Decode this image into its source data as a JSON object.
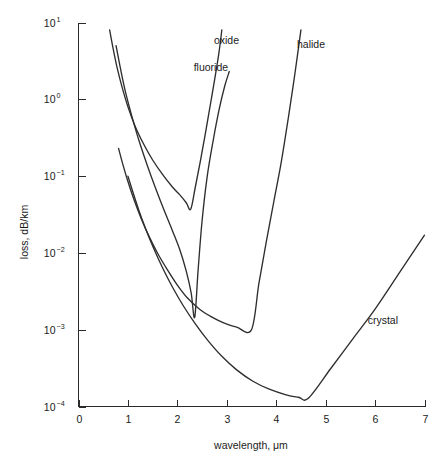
{
  "chart_data": {
    "type": "line",
    "title": "",
    "xlabel": "wavelength, μm",
    "ylabel": "loss, dB/km",
    "xlim": [
      0,
      7
    ],
    "ylim": [
      0.0001,
      10
    ],
    "yscale": "log",
    "xscale": "linear",
    "grid": false,
    "legend_position": "inline-annotations",
    "xticks": [
      "0",
      "1",
      "2",
      "3",
      "4",
      "5",
      "6",
      "7"
    ],
    "xtick_values": [
      0,
      1,
      2,
      3,
      4,
      5,
      6,
      7
    ],
    "yticks": [
      "10¹",
      "10⁰",
      "10⁻¹",
      "10⁻²",
      "10⁻³",
      "10⁻⁴"
    ],
    "ytick_values": [
      10,
      1,
      0.1,
      0.01,
      0.001,
      0.0001
    ],
    "ytick_mantissa": "10",
    "ytick_exponents": [
      "1",
      "0",
      "-1",
      "-2",
      "-3",
      "-4"
    ],
    "series": [
      {
        "name": "oxide",
        "label": "oxide",
        "label_x": 2.74,
        "label_y": 5.2,
        "points": [
          [
            0.63,
            8.0
          ],
          [
            0.7,
            4.6
          ],
          [
            0.78,
            2.6
          ],
          [
            0.88,
            1.45
          ],
          [
            1.0,
            0.8
          ],
          [
            1.15,
            0.44
          ],
          [
            1.32,
            0.26
          ],
          [
            1.5,
            0.162
          ],
          [
            1.7,
            0.105
          ],
          [
            1.9,
            0.072
          ],
          [
            2.05,
            0.057
          ],
          [
            2.18,
            0.045
          ],
          [
            2.27,
            0.037
          ],
          [
            2.36,
            0.07
          ],
          [
            2.46,
            0.15
          ],
          [
            2.56,
            0.34
          ],
          [
            2.66,
            0.8
          ],
          [
            2.76,
            1.9
          ],
          [
            2.84,
            4.0
          ],
          [
            2.9,
            8.0
          ]
        ]
      },
      {
        "name": "fluoride",
        "label": "fluoride",
        "label_x": 2.33,
        "label_y": 2.35,
        "points": [
          [
            0.76,
            5.0
          ],
          [
            0.85,
            2.5
          ],
          [
            0.95,
            1.25
          ],
          [
            1.08,
            0.6
          ],
          [
            1.22,
            0.295
          ],
          [
            1.38,
            0.145
          ],
          [
            1.55,
            0.072
          ],
          [
            1.72,
            0.0375
          ],
          [
            1.9,
            0.0195
          ],
          [
            2.05,
            0.011
          ],
          [
            2.18,
            0.0058
          ],
          [
            2.28,
            0.003
          ],
          [
            2.35,
            0.00145
          ],
          [
            2.42,
            0.006
          ],
          [
            2.5,
            0.026
          ],
          [
            2.6,
            0.095
          ],
          [
            2.72,
            0.28
          ],
          [
            2.85,
            0.76
          ],
          [
            2.96,
            1.5
          ],
          [
            3.05,
            2.3
          ]
        ]
      },
      {
        "name": "halide",
        "label": "halide",
        "label_x": 4.42,
        "label_y": 4.6,
        "points": [
          [
            0.81,
            0.23
          ],
          [
            0.9,
            0.14
          ],
          [
            1.0,
            0.085
          ],
          [
            1.12,
            0.05
          ],
          [
            1.26,
            0.029
          ],
          [
            1.42,
            0.0168
          ],
          [
            1.6,
            0.0099
          ],
          [
            1.8,
            0.006
          ],
          [
            2.0,
            0.0038
          ],
          [
            2.2,
            0.0026
          ],
          [
            2.45,
            0.00185
          ],
          [
            2.7,
            0.00146
          ],
          [
            2.95,
            0.00122
          ],
          [
            3.2,
            0.00108
          ],
          [
            3.5,
            0.001
          ],
          [
            3.65,
            0.004
          ],
          [
            3.8,
            0.014
          ],
          [
            3.95,
            0.046
          ],
          [
            4.1,
            0.15
          ],
          [
            4.25,
            0.6
          ],
          [
            4.38,
            2.2
          ],
          [
            4.5,
            8.0
          ]
        ]
      },
      {
        "name": "crystal",
        "label": "crystal",
        "label_x": 5.85,
        "label_y": 0.00118,
        "points": [
          [
            1.0,
            0.1
          ],
          [
            1.1,
            0.062
          ],
          [
            1.22,
            0.036
          ],
          [
            1.36,
            0.0205
          ],
          [
            1.52,
            0.0115
          ],
          [
            1.7,
            0.0064
          ],
          [
            1.9,
            0.0036
          ],
          [
            2.12,
            0.00205
          ],
          [
            2.36,
            0.0012
          ],
          [
            2.62,
            0.00072
          ],
          [
            2.9,
            0.00045
          ],
          [
            3.2,
            0.0003
          ],
          [
            3.52,
            0.000215
          ],
          [
            3.86,
            0.000168
          ],
          [
            4.2,
            0.000142
          ],
          [
            4.45,
            0.000132
          ],
          [
            4.65,
            0.000128
          ],
          [
            5.1,
            0.00031
          ],
          [
            5.55,
            0.00076
          ],
          [
            6.0,
            0.00185
          ],
          [
            6.5,
            0.0056
          ],
          [
            7.0,
            0.017
          ]
        ]
      }
    ]
  },
  "axes": {
    "x_title": "wavelength, μm",
    "y_title": "loss, dB/km"
  },
  "colors": {
    "curve": "#2e2e2e",
    "axis": "#2b2b2b",
    "text": "#1a1a1a",
    "background": "#ffffff"
  }
}
